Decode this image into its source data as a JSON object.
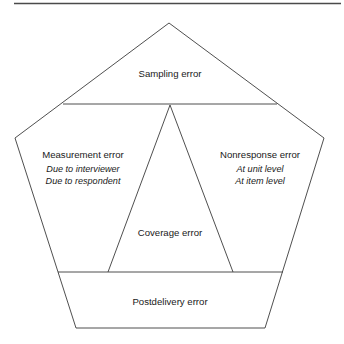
{
  "figure": {
    "type": "diagram",
    "shape": "pentagon",
    "background_color": "#ffffff",
    "line_color": "#3b3b3b",
    "text_color": "#1a1a1a"
  },
  "top_rule": {
    "visible": true,
    "color": "#4a4a4a"
  },
  "regions": {
    "sampling": {
      "name": "sampling-error-region",
      "title": "Sampling error",
      "sublabels": []
    },
    "measurement": {
      "name": "measurement-error-region",
      "title": "Measurement error",
      "sublabels": [
        "Due to interviewer",
        "Due to respondent"
      ]
    },
    "nonresponse": {
      "name": "nonresponse-error-region",
      "title": "Nonresponse error",
      "sublabels": [
        "At unit level",
        "At item level"
      ]
    },
    "coverage": {
      "name": "coverage-error-region",
      "title": "Coverage error",
      "sublabels": []
    },
    "postdelivery": {
      "name": "postdelivery-error-region",
      "title": "Postdelivery error",
      "sublabels": []
    }
  },
  "geometry": {
    "pentagon_points": "169,23 324,138 265,328 76,328 15,138",
    "upper_divider": {
      "x1": 63,
      "y1": 104,
      "x2": 277,
      "y2": 104
    },
    "lower_divider": {
      "x1": 58,
      "y1": 272,
      "x2": 283,
      "y2": 272
    },
    "coverage_triangle": "170,105 233,272 108,272",
    "top_rule_line": {
      "x1": 14,
      "y1": 3.5,
      "x2": 341,
      "y2": 3.5
    }
  }
}
